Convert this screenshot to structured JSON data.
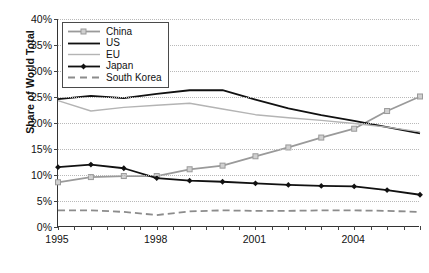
{
  "chart_data": {
    "type": "line",
    "title": "",
    "xlabel": "",
    "ylabel": "Share of World Total",
    "ylim": [
      0,
      40
    ],
    "yunit": "%",
    "ytick_labels": [
      "0%",
      "5%",
      "10%",
      "15%",
      "20%",
      "25%",
      "30%",
      "35%",
      "40%"
    ],
    "ytick_values": [
      0,
      5,
      10,
      15,
      20,
      25,
      30,
      35,
      40
    ],
    "xlim": [
      1995,
      2006
    ],
    "xtick_labels": [
      "1995",
      "1998",
      "2001",
      "2004"
    ],
    "xtick_values": [
      1995,
      1998,
      2001,
      2004
    ],
    "minor_tick_interval": 0.5,
    "grid": "horizontal-dotted",
    "legend_position": "top-left",
    "x": [
      1995,
      1996,
      1997,
      1998,
      1999,
      2000,
      2001,
      2002,
      2003,
      2004,
      2005,
      2006
    ],
    "series": [
      {
        "name": "China",
        "color": "#9a9a9a",
        "style": "solid-marker",
        "marker": "square",
        "values": [
          8.6,
          9.6,
          9.8,
          9.8,
          11.1,
          11.8,
          13.6,
          15.3,
          17.2,
          18.9,
          22.3,
          25.1
        ]
      },
      {
        "name": "US",
        "color": "#111111",
        "style": "solid",
        "marker": "none",
        "values": [
          24.6,
          25.2,
          24.8,
          25.6,
          26.3,
          26.3,
          24.5,
          22.8,
          21.5,
          20.4,
          19.2,
          18.0
        ]
      },
      {
        "name": "EU",
        "color": "#b4b4b4",
        "style": "solid",
        "marker": "none",
        "values": [
          24.3,
          22.3,
          23.0,
          23.4,
          23.8,
          22.7,
          21.6,
          21.0,
          20.5,
          19.9,
          19.2,
          18.3
        ]
      },
      {
        "name": "Japan",
        "color": "#111111",
        "style": "solid-marker",
        "marker": "diamond",
        "values": [
          11.5,
          12.0,
          11.3,
          9.4,
          8.9,
          8.7,
          8.4,
          8.1,
          7.9,
          7.8,
          7.1,
          6.2
        ]
      },
      {
        "name": "South Korea",
        "color": "#8c8c8c",
        "style": "dashed",
        "marker": "none",
        "values": [
          3.2,
          3.2,
          2.9,
          2.3,
          3.0,
          3.2,
          3.1,
          3.1,
          3.2,
          3.2,
          3.1,
          2.9
        ]
      }
    ]
  }
}
